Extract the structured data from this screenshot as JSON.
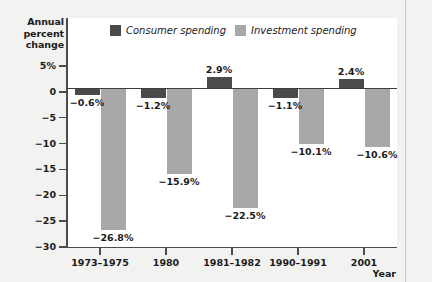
{
  "chart_data": {
    "type": "bar",
    "title": "",
    "xlabel": "Year",
    "ylabel": "Annual percent change",
    "ylim": [
      -30,
      5
    ],
    "grid": false,
    "legend_position": "top-center",
    "categories": [
      "1973–1975",
      "1980",
      "1981–1982",
      "1990–1991",
      "2001"
    ],
    "ytick_labels": [
      "5%",
      "0",
      "−5",
      "−10",
      "−15",
      "−20",
      "−25",
      "−30"
    ],
    "ytick_values": [
      5,
      0,
      -5,
      -10,
      -15,
      -20,
      -25,
      -30
    ],
    "series": [
      {
        "name": "Consumer spending",
        "color": "#4a4a4a",
        "values": [
          -0.6,
          -1.2,
          2.9,
          -1.1,
          2.4
        ],
        "labels": [
          "−0.6%",
          "−1.2%",
          "2.9%",
          "−1.1%",
          "2.4%"
        ]
      },
      {
        "name": "Investment spending",
        "color": "#a8a8a8",
        "values": [
          -26.8,
          -15.9,
          -22.5,
          -10.1,
          -10.6
        ],
        "labels": [
          "−26.8%",
          "−15.9%",
          "−22.5%",
          "−10.1%",
          "−10.6%"
        ]
      }
    ]
  },
  "axis": {
    "y_title_line1": "Annual",
    "y_title_line2": "percent",
    "y_title_line3": "change",
    "x_title": "Year"
  },
  "colors": {
    "page_background": "#f2f2f0",
    "plot_background": "#ffffff",
    "axis": "#4c4c4c",
    "text": "#1b1b1b",
    "consumer": "#4a4a4a",
    "investment": "#a8a8a8",
    "divider": "#c9c9c6"
  }
}
